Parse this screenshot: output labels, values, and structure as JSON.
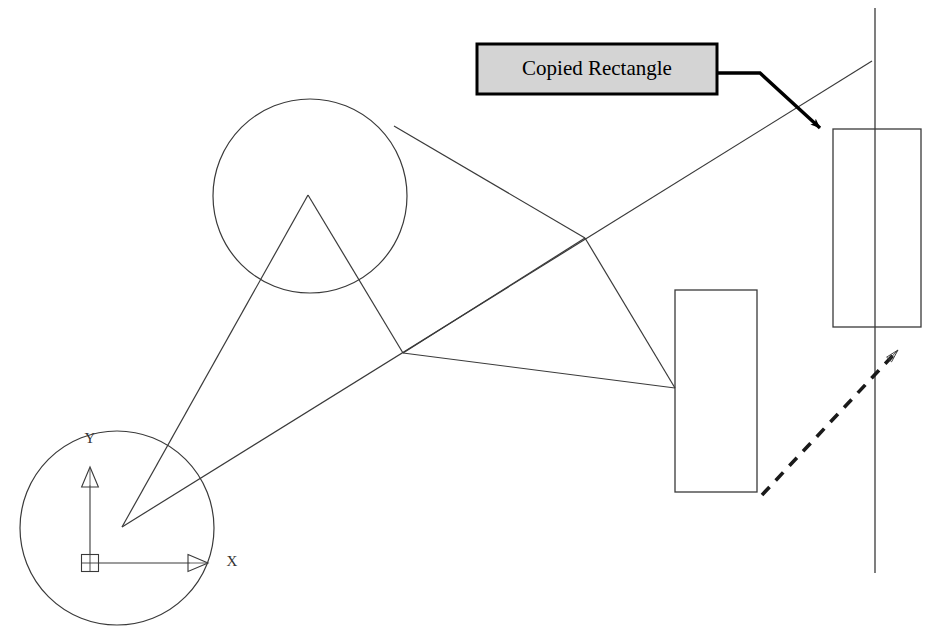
{
  "canvas": {
    "width": 937,
    "height": 636,
    "background": "#ffffff",
    "stroke_color": "#1a1a1a",
    "thin_stroke_color": "#3a3a3a",
    "callout_fill": "#d4d4d4",
    "callout_border": "#000000"
  },
  "callout": {
    "label": "Copied Rectangle",
    "box": {
      "x": 477,
      "y": 44,
      "width": 240,
      "height": 50
    },
    "text_x": 597,
    "text_y": 69,
    "leader": {
      "start_x": 717,
      "start_y": 73,
      "bend_x": 760,
      "bend_y": 73,
      "tip_x": 826,
      "tip_y": 134,
      "arrow_style": "solid-filled"
    }
  },
  "shapes": {
    "copied_rectangle": {
      "name": "Copied Rectangle",
      "x": 833,
      "y": 129,
      "width": 88,
      "height": 198
    },
    "original_rectangle": {
      "name": "Original Rectangle",
      "x": 675,
      "y": 290,
      "width": 82,
      "height": 202
    },
    "upper_circle": {
      "cx": 310,
      "cy": 196,
      "r": 97
    },
    "lower_circle": {
      "cx": 117,
      "cy": 528,
      "r": 97
    },
    "vertical_line": {
      "x": 875,
      "y1": 8,
      "y2": 573
    },
    "long_diagonal": {
      "x1": 122,
      "y1": 527,
      "x2": 872,
      "y2": 61
    }
  },
  "ucs_icon": {
    "name": "UCS coordinate system icon",
    "origin_x": 90,
    "origin_y": 563,
    "square_size": 17,
    "x_axis": {
      "to_x": 205,
      "to_y": 563,
      "label": "X",
      "label_x": 232,
      "label_y": 563
    },
    "y_axis": {
      "to_x": 90,
      "to_y": 470,
      "label": "Y",
      "label_x": 90,
      "label_y": 440
    }
  },
  "wireframe": {
    "apex": {
      "x": 308,
      "y": 195
    },
    "lower_vertex": {
      "x": 122,
      "y": 527
    },
    "mid_vertex": {
      "x": 403,
      "y": 353
    },
    "right_vertex": {
      "x": 585,
      "y": 238
    },
    "rect_attach": {
      "x": 675,
      "y": 388
    },
    "segments": [
      {
        "from": "apex",
        "to": "lower_vertex"
      },
      {
        "from": "apex",
        "to": "mid_vertex"
      },
      {
        "from": "mid_vertex",
        "to": "right_vertex"
      },
      {
        "from": "right_vertex",
        "to": "rect_attach"
      },
      {
        "from": "mid_vertex",
        "to": "rect_attach"
      },
      {
        "from": "upper_circle_edge",
        "to": "right_vertex"
      }
    ]
  },
  "displacement_arrow": {
    "name": "displacement vector",
    "style": "dashed",
    "start_x": 762,
    "start_y": 495,
    "end_x": 909,
    "end_y": 338,
    "arrow_style": "open-outline",
    "dash_pattern": "11 9"
  }
}
